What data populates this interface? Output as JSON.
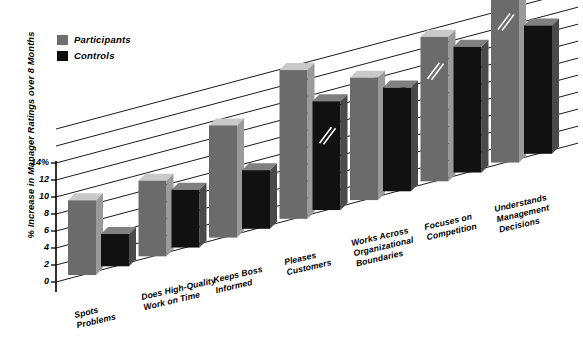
{
  "legend": {
    "items": [
      {
        "label": "Participants",
        "color": "#6b6b6b",
        "swatch": "participants-swatch"
      },
      {
        "label": "Controls",
        "color": "#111111",
        "swatch": "controls-swatch"
      }
    ]
  },
  "axis": {
    "y_title": "% Increase in Manager Ratings over 8 Months",
    "y_ticks": [
      "0",
      "2",
      "4",
      "6",
      "8",
      "10",
      "12",
      "14%"
    ]
  },
  "chart_data": {
    "type": "bar",
    "title": "",
    "xlabel": "",
    "ylabel": "% Increase in Manager Ratings over 8 Months",
    "ylim": [
      0,
      14
    ],
    "ytick_values": [
      0,
      2,
      4,
      6,
      8,
      10,
      12,
      14
    ],
    "ytick_labels": [
      "0",
      "2",
      "4",
      "6",
      "8",
      "10",
      "12",
      "14%"
    ],
    "grid": true,
    "legend_position": "top-left",
    "projection": "3d-sloped-baseline",
    "categories": [
      "Spots Problems",
      "Does High-Quality Work on Time",
      "Keeps Boss Informed",
      "Pleases Customers",
      "Works Across Organizational Boundaries",
      "Focuses on Competition",
      "Understands Management Decisions"
    ],
    "category_lines": [
      [
        "Spots",
        "Problems"
      ],
      [
        "Does High-Quality",
        "Work on Time"
      ],
      [
        "Keeps Boss",
        "Informed"
      ],
      [
        "Pleases",
        "Customers"
      ],
      [
        "Works Across",
        "Organizational",
        "Boundaries"
      ],
      [
        "Focuses on",
        "Competition"
      ],
      [
        "Understands",
        "Management",
        "Decisions"
      ]
    ],
    "series": [
      {
        "name": "Participants",
        "color": "#6b6b6b",
        "values": [
          8.8,
          8.9,
          13.2,
          17.5,
          14.4,
          17.0,
          20.6
        ]
      },
      {
        "name": "Controls",
        "color": "#111111",
        "values": [
          3.8,
          6.8,
          6.9,
          12.8,
          12.2,
          14.8,
          15.1
        ]
      }
    ]
  }
}
